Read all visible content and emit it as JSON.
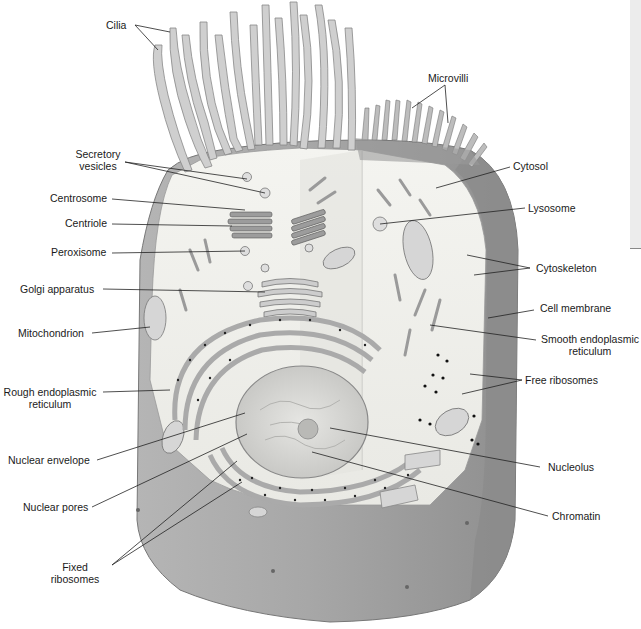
{
  "diagram": {
    "colors": {
      "membrane_dark": "#8d8d8d",
      "membrane_mid": "#a9a9a9",
      "cytosol": "#efefea",
      "organelle": "#cfcfcf",
      "leader_line": "#222222"
    }
  },
  "labels": {
    "cilia": "Cilia",
    "microvilli": "Microvilli",
    "secretory_vesicles_1": "Secretory",
    "secretory_vesicles_2": "vesicles",
    "cytosol": "Cytosol",
    "centrosome": "Centrosome",
    "lysosome": "Lysosome",
    "centriole": "Centriole",
    "peroxisome": "Peroxisome",
    "cytoskeleton": "Cytoskeleton",
    "golgi": "Golgi apparatus",
    "cell_membrane": "Cell membrane",
    "mitochondrion": "Mitochondrion",
    "smooth_er_1": "Smooth endoplasmic",
    "smooth_er_2": "reticulum",
    "rough_er_1": "Rough endoplasmic",
    "rough_er_2": "reticulum",
    "free_ribosomes": "Free ribosomes",
    "nuclear_envelope": "Nuclear envelope",
    "nucleolus": "Nucleolus",
    "nuclear_pores": "Nuclear pores",
    "chromatin": "Chromatin",
    "fixed_ribosomes_1": "Fixed",
    "fixed_ribosomes_2": "ribosomes"
  }
}
